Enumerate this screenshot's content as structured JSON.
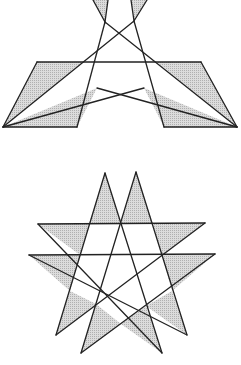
{
  "figure": {
    "colors": {
      "stroke": "#222222",
      "shade": "#c8c8c8",
      "background": "#ffffff"
    }
  },
  "top_figure": {
    "name": "parallelogram-crossing",
    "points": {
      "tl_tri_left": [
        93,
        0
      ],
      "tl_tri_right": [
        108,
        0
      ],
      "tl_apex": [
        105,
        22
      ],
      "tr_tri_left": [
        131,
        0
      ],
      "tr_tri_right": [
        147,
        0
      ],
      "tr_apex": [
        134,
        21
      ],
      "left_para": [
        [
          37,
          62
        ],
        [
          82,
          62
        ],
        [
          77,
          127
        ],
        [
          3,
          127
        ]
      ],
      "right_para": [
        [
          157,
          62
        ],
        [
          201,
          62
        ],
        [
          237,
          127
        ],
        [
          164,
          127
        ]
      ]
    }
  },
  "bottom_figure": {
    "name": "double-pentagram",
    "star_a": {
      "top": [
        105,
        173
      ],
      "left": [
        38,
        224
      ],
      "right": [
        205,
        223
      ],
      "bottom_left": [
        56,
        335
      ],
      "bottom_right": [
        162,
        353
      ]
    },
    "star_b": {
      "top": [
        136,
        172
      ],
      "left": [
        29,
        255
      ],
      "right": [
        215,
        254
      ],
      "bottom_left": [
        81,
        353
      ],
      "bottom_right": [
        187,
        335
      ]
    }
  }
}
